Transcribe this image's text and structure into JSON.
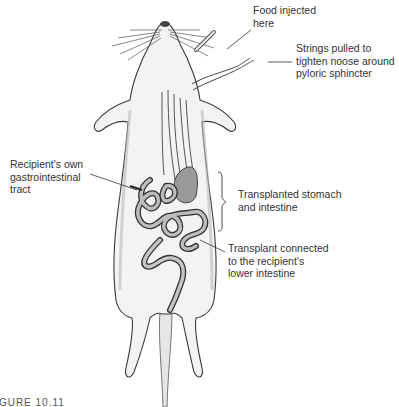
{
  "figure": {
    "caption": "FIGURE 10.11",
    "labels": {
      "food_injected": "Food injected\nhere",
      "strings_pulled": "Strings pulled to\ntighten noose around\npyloric sphincter",
      "recipient_gi": "Recipient's own\ngastrointestinal\ntract",
      "transplanted": "Transplanted stomach\nand intestine",
      "transplant_connected": "Transplant connected\nto the recipient's\nlower intestine"
    },
    "colors": {
      "line": "#333333",
      "body_shade": "#d8d8d8",
      "organ_fill": "#9a9a9a",
      "background": "#ffffff"
    }
  }
}
